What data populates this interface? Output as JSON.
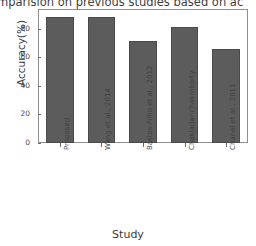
{
  "chart_data": {
    "type": "bar",
    "title": "omparision on previous studies based on ac",
    "xlabel": "Study",
    "ylabel": "Accuracy(%)",
    "categories": [
      "Proposed",
      "Wang et al., 2014",
      "Bastos-Filho et al., 2012",
      "Chakladar-chakroborty",
      "Chanel et al., 2011"
    ],
    "values": [
      88,
      88,
      71,
      81,
      66
    ],
    "ylim": [
      0,
      93
    ],
    "yticks": [
      0,
      20,
      40,
      60,
      80
    ],
    "ytick_labels": [
      "0",
      "20",
      "40",
      "60",
      "80"
    ],
    "grid": false,
    "legend": false,
    "bar_color": "#5c5c5c",
    "frame_color": "#8e8e8e",
    "background": "#ffffff"
  }
}
